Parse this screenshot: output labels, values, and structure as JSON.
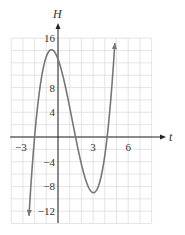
{
  "chart_data": {
    "type": "line",
    "title": "",
    "xlabel": "t",
    "ylabel": "H",
    "xlim": [
      -4,
      8
    ],
    "ylim": [
      -14,
      16
    ],
    "grid": true,
    "x_grid_step": 1,
    "y_grid_step": 2,
    "x_ticks": [
      {
        "value": -3,
        "label": "−3"
      },
      {
        "value": 3,
        "label": "3"
      },
      {
        "value": 6,
        "label": "6"
      }
    ],
    "y_ticks": [
      {
        "value": 16,
        "label": "16"
      },
      {
        "value": 8,
        "label": "8"
      },
      {
        "value": 4,
        "label": "4"
      },
      {
        "value": -4,
        "label": "−4"
      },
      {
        "value": -8,
        "label": "−8"
      },
      {
        "value": -12,
        "label": "−12"
      }
    ],
    "series": [
      {
        "name": "H(t)",
        "description": "cubic curve with arrows at both ends; zeros near t=-2, 1.5, 4.2; local max ≈13 near t≈-0.6; local min ≈-9 near t≈3.1",
        "x": [
          -2.5,
          -2.25,
          -2.0,
          -1.75,
          -1.5,
          -1.25,
          -1.0,
          -0.75,
          -0.5,
          -0.25,
          0,
          0.25,
          0.5,
          0.75,
          1.0,
          1.25,
          1.5,
          1.75,
          2.0,
          2.25,
          2.5,
          2.75,
          3.0,
          3.25,
          3.5,
          3.75,
          4.0,
          4.25,
          4.5,
          4.75,
          4.9
        ],
        "y": [
          -14.2,
          -6.9,
          0.0,
          5.1,
          8.7,
          11.1,
          12.5,
          13.1,
          13.0,
          12.0,
          12.6,
          10.6,
          8.4,
          6.0,
          3.7,
          1.4,
          0.0,
          -2.2,
          -4.4,
          -6.1,
          -7.5,
          -8.5,
          -9.0,
          -8.9,
          -8.2,
          -6.8,
          -4.4,
          -1.0,
          3.3,
          8.6,
          12.6
        ]
      }
    ],
    "color": "#777777",
    "axis_color": "#222222",
    "grid_color": "#dddddd"
  }
}
